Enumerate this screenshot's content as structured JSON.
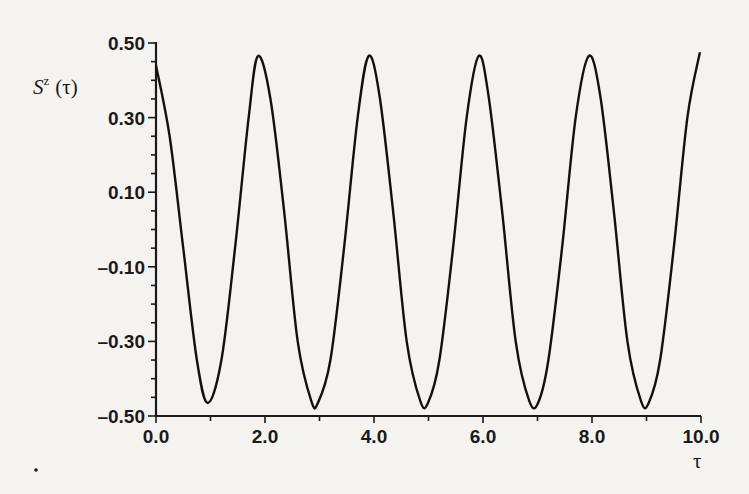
{
  "chart_data": {
    "type": "line",
    "title": "",
    "xlabel": "τ",
    "ylabel": "S^z (τ)",
    "ylabel_main": "S",
    "ylabel_sup": "z",
    "ylabel_arg": "(τ)",
    "xlim": [
      0.0,
      10.0
    ],
    "ylim": [
      -0.5,
      0.5
    ],
    "grid": false,
    "legend": "none",
    "x_ticks": [
      "0.0",
      "2.0",
      "4.0",
      "6.0",
      "8.0",
      "10.0"
    ],
    "y_ticks": [
      "0.50",
      "0.30",
      "0.10",
      "–0.10",
      "–0.30",
      "–0.50"
    ],
    "series": [
      {
        "name": "S^z(τ)",
        "x": [
          0.0,
          0.25,
          0.5,
          0.75,
          0.95,
          1.2,
          1.45,
          1.7,
          1.87,
          2.1,
          2.35,
          2.6,
          2.85,
          2.97,
          3.2,
          3.45,
          3.7,
          3.9,
          4.1,
          4.35,
          4.6,
          4.85,
          4.99,
          5.2,
          5.45,
          5.7,
          5.92,
          6.1,
          6.35,
          6.6,
          6.85,
          7.01,
          7.2,
          7.45,
          7.7,
          7.94,
          8.15,
          8.4,
          8.65,
          8.9,
          9.04,
          9.25,
          9.5,
          9.75,
          9.98
        ],
        "values": [
          0.44,
          0.25,
          -0.05,
          -0.35,
          -0.465,
          -0.35,
          -0.05,
          0.3,
          0.465,
          0.35,
          0.05,
          -0.3,
          -0.46,
          -0.465,
          -0.35,
          -0.05,
          0.3,
          0.465,
          0.36,
          0.05,
          -0.3,
          -0.46,
          -0.465,
          -0.35,
          -0.05,
          0.3,
          0.465,
          0.36,
          0.05,
          -0.3,
          -0.46,
          -0.465,
          -0.35,
          -0.05,
          0.3,
          0.465,
          0.36,
          0.05,
          -0.3,
          -0.46,
          -0.465,
          -0.35,
          -0.05,
          0.3,
          0.475
        ]
      }
    ]
  }
}
